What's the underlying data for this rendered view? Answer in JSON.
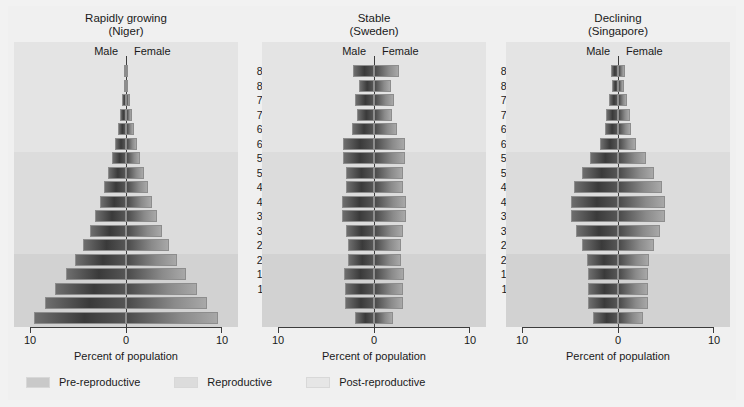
{
  "figure": {
    "axis_title": "Percent of population",
    "male_label": "Male",
    "female_label": "Female",
    "x_tick_left": "10",
    "x_tick_center": "0",
    "x_tick_right": "10"
  },
  "age_groups": [
    "86–90",
    "81–85",
    "76–80",
    "71–75",
    "66–70",
    "61–65",
    "56–60",
    "51–55",
    "46–50",
    "41–45",
    "36–40",
    "31–35",
    "26–30",
    "21–25",
    "16–20",
    "11–15",
    "6–10",
    "0–5"
  ],
  "legend": {
    "items": [
      {
        "label": "Pre-reproductive",
        "color": "#c9c9c9"
      },
      {
        "label": "Reproductive",
        "color": "#dcdcdc"
      },
      {
        "label": "Post-reproductive",
        "color": "#e6e6e6"
      }
    ]
  },
  "panels": [
    {
      "key": "niger",
      "title": "Rapidly growing\n(Niger)"
    },
    {
      "key": "sweden",
      "title": "Stable\n(Sweden)"
    },
    {
      "key": "singapore",
      "title": "Declining\n(Singapore)"
    }
  ],
  "chart_data": [
    {
      "type": "bar",
      "title": "Rapidly growing (Niger)",
      "subtitle": "Population age structure pyramid",
      "xlabel": "Percent of population",
      "ylabel": "Age group",
      "xlim": [
        -10,
        10
      ],
      "xticks": [
        -10,
        0,
        10
      ],
      "xticklabels": [
        "10",
        "0",
        "10"
      ],
      "grid": false,
      "legend_position": "bottom",
      "categories": [
        "86–90",
        "81–85",
        "76–80",
        "71–75",
        "66–70",
        "61–65",
        "56–60",
        "51–55",
        "46–50",
        "41–45",
        "36–40",
        "31–35",
        "26–30",
        "21–25",
        "16–20",
        "11–15",
        "6–10",
        "0–5"
      ],
      "series": [
        {
          "name": "Male",
          "values": [
            0.15,
            0.25,
            0.4,
            0.6,
            0.85,
            1.15,
            1.5,
            1.9,
            2.3,
            2.7,
            3.2,
            3.8,
            4.5,
            5.3,
            6.3,
            7.4,
            8.4,
            9.6
          ]
        },
        {
          "name": "Female",
          "values": [
            0.15,
            0.25,
            0.4,
            0.6,
            0.85,
            1.15,
            1.5,
            1.9,
            2.3,
            2.7,
            3.2,
            3.8,
            4.5,
            5.3,
            6.3,
            7.4,
            8.4,
            9.6
          ]
        }
      ]
    },
    {
      "type": "bar",
      "title": "Stable (Sweden)",
      "subtitle": "Population age structure pyramid",
      "xlabel": "Percent of population",
      "ylabel": "Age group",
      "xlim": [
        -10,
        10
      ],
      "xticks": [
        -10,
        0,
        10
      ],
      "xticklabels": [
        "10",
        "0",
        "10"
      ],
      "grid": false,
      "legend_position": "bottom",
      "categories": [
        "86–90",
        "81–85",
        "76–80",
        "71–75",
        "66–70",
        "61–65",
        "56–60",
        "51–55",
        "46–50",
        "41–45",
        "36–40",
        "31–35",
        "26–30",
        "21–25",
        "16–20",
        "11–15",
        "6–10",
        "0–5"
      ],
      "series": [
        {
          "name": "Male",
          "values": [
            2.2,
            1.6,
            2.0,
            1.8,
            2.3,
            3.2,
            3.2,
            2.9,
            2.9,
            3.3,
            3.3,
            2.9,
            2.7,
            2.7,
            3.1,
            3.0,
            3.0,
            2.0
          ]
        },
        {
          "name": "Female",
          "values": [
            2.6,
            1.8,
            2.1,
            1.9,
            2.4,
            3.2,
            3.2,
            3.0,
            3.0,
            3.3,
            3.3,
            3.0,
            2.8,
            2.8,
            3.1,
            3.0,
            3.0,
            2.0
          ]
        }
      ]
    },
    {
      "type": "bar",
      "title": "Declining (Singapore)",
      "subtitle": "Population age structure pyramid",
      "xlabel": "Percent of population",
      "ylabel": "Age group",
      "xlim": [
        -10,
        10
      ],
      "xticks": [
        -10,
        0,
        10
      ],
      "xticklabels": [
        "10",
        "0",
        "10"
      ],
      "grid": false,
      "legend_position": "bottom",
      "categories": [
        "86–90",
        "81–85",
        "76–80",
        "71–75",
        "66–70",
        "61–65",
        "56–60",
        "51–55",
        "46–50",
        "41–45",
        "36–40",
        "31–35",
        "26–30",
        "21–25",
        "16–20",
        "11–15",
        "6–10",
        "0–5"
      ],
      "series": [
        {
          "name": "Male",
          "values": [
            0.7,
            0.6,
            0.9,
            1.2,
            1.4,
            1.9,
            2.9,
            3.7,
            4.6,
            4.9,
            4.9,
            4.4,
            3.7,
            3.2,
            3.1,
            3.1,
            3.1,
            2.6
          ]
        },
        {
          "name": "Female",
          "values": [
            0.7,
            0.6,
            0.9,
            1.2,
            1.4,
            1.9,
            2.9,
            3.7,
            4.6,
            4.9,
            4.9,
            4.4,
            3.7,
            3.2,
            3.1,
            3.1,
            3.1,
            2.6
          ]
        }
      ]
    }
  ]
}
